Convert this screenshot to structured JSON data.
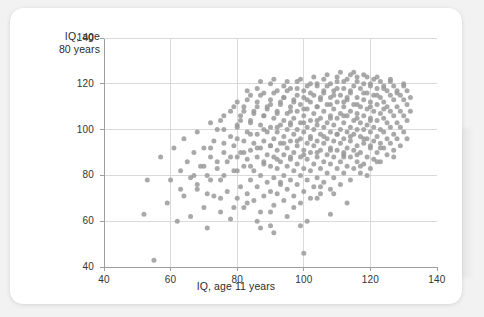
{
  "chart_data": {
    "type": "scatter",
    "title": "",
    "xlabel": "IQ, age 11 years",
    "ylabel": "IQ, age\n80 years",
    "xlim": [
      40,
      140
    ],
    "ylim": [
      40,
      140
    ],
    "xticks": [
      40,
      60,
      80,
      100,
      120,
      140
    ],
    "yticks": [
      40,
      60,
      80,
      100,
      120,
      140
    ],
    "grid": true,
    "legend": null,
    "marker": {
      "shape": "circle",
      "color": "#9a9a9a",
      "size_px": 5,
      "opacity": 0.85
    },
    "n_points": 420,
    "points": [
      [
        53,
        78
      ],
      [
        52,
        63
      ],
      [
        55,
        43
      ],
      [
        57,
        88
      ],
      [
        59,
        68
      ],
      [
        60,
        78
      ],
      [
        61,
        92
      ],
      [
        62,
        60
      ],
      [
        63,
        82
      ],
      [
        64,
        71
      ],
      [
        64,
        96
      ],
      [
        65,
        86
      ],
      [
        66,
        62
      ],
      [
        66,
        79
      ],
      [
        67,
        90
      ],
      [
        68,
        74
      ],
      [
        68,
        99
      ],
      [
        69,
        84
      ],
      [
        70,
        66
      ],
      [
        70,
        92
      ],
      [
        71,
        57
      ],
      [
        71,
        80
      ],
      [
        72,
        88
      ],
      [
        72,
        103
      ],
      [
        73,
        71
      ],
      [
        73,
        95
      ],
      [
        74,
        83
      ],
      [
        74,
        100
      ],
      [
        75,
        64
      ],
      [
        75,
        78
      ],
      [
        76,
        90
      ],
      [
        76,
        106
      ],
      [
        77,
        73
      ],
      [
        77,
        86
      ],
      [
        78,
        97
      ],
      [
        78,
        61
      ],
      [
        79,
        82
      ],
      [
        79,
        93
      ],
      [
        80,
        70
      ],
      [
        80,
        88
      ],
      [
        80,
        101
      ],
      [
        80,
        112
      ],
      [
        81,
        75
      ],
      [
        81,
        90
      ],
      [
        81,
        104
      ],
      [
        82,
        66
      ],
      [
        82,
        84
      ],
      [
        82,
        95
      ],
      [
        82,
        108
      ],
      [
        83,
        72
      ],
      [
        83,
        87
      ],
      [
        83,
        99
      ],
      [
        83,
        113
      ],
      [
        84,
        78
      ],
      [
        84,
        91
      ],
      [
        84,
        103
      ],
      [
        85,
        69
      ],
      [
        85,
        82
      ],
      [
        85,
        94
      ],
      [
        85,
        107
      ],
      [
        86,
        75
      ],
      [
        86,
        88
      ],
      [
        86,
        98
      ],
      [
        86,
        110
      ],
      [
        87,
        64
      ],
      [
        87,
        80
      ],
      [
        87,
        92
      ],
      [
        87,
        102
      ],
      [
        87,
        115
      ],
      [
        88,
        71
      ],
      [
        88,
        85
      ],
      [
        88,
        95
      ],
      [
        88,
        106
      ],
      [
        89,
        77
      ],
      [
        89,
        89
      ],
      [
        89,
        99
      ],
      [
        89,
        109
      ],
      [
        90,
        58
      ],
      [
        90,
        73
      ],
      [
        90,
        84
      ],
      [
        90,
        93
      ],
      [
        90,
        101
      ],
      [
        90,
        111
      ],
      [
        91,
        67
      ],
      [
        91,
        79
      ],
      [
        91,
        88
      ],
      [
        91,
        96
      ],
      [
        91,
        105
      ],
      [
        91,
        116
      ],
      [
        92,
        72
      ],
      [
        92,
        83
      ],
      [
        92,
        91
      ],
      [
        92,
        99
      ],
      [
        92,
        108
      ],
      [
        93,
        76
      ],
      [
        93,
        86
      ],
      [
        93,
        94
      ],
      [
        93,
        102
      ],
      [
        93,
        112
      ],
      [
        94,
        69
      ],
      [
        94,
        80
      ],
      [
        94,
        89
      ],
      [
        94,
        97
      ],
      [
        94,
        104
      ],
      [
        94,
        114
      ],
      [
        95,
        74
      ],
      [
        95,
        84
      ],
      [
        95,
        92
      ],
      [
        95,
        100
      ],
      [
        95,
        107
      ],
      [
        95,
        117
      ],
      [
        96,
        78
      ],
      [
        96,
        87
      ],
      [
        96,
        95
      ],
      [
        96,
        103
      ],
      [
        96,
        110
      ],
      [
        97,
        71
      ],
      [
        97,
        82
      ],
      [
        97,
        90
      ],
      [
        97,
        98
      ],
      [
        97,
        105
      ],
      [
        97,
        113
      ],
      [
        98,
        76
      ],
      [
        98,
        85
      ],
      [
        98,
        93
      ],
      [
        98,
        100
      ],
      [
        98,
        108
      ],
      [
        98,
        118
      ],
      [
        99,
        68
      ],
      [
        99,
        80
      ],
      [
        99,
        88
      ],
      [
        99,
        96
      ],
      [
        99,
        103
      ],
      [
        99,
        111
      ],
      [
        100,
        46
      ],
      [
        100,
        73
      ],
      [
        100,
        83
      ],
      [
        100,
        91
      ],
      [
        100,
        99
      ],
      [
        100,
        106
      ],
      [
        100,
        114
      ],
      [
        101,
        78
      ],
      [
        101,
        87
      ],
      [
        101,
        94
      ],
      [
        101,
        101
      ],
      [
        101,
        109
      ],
      [
        101,
        119
      ],
      [
        102,
        70
      ],
      [
        102,
        82
      ],
      [
        102,
        90
      ],
      [
        102,
        97
      ],
      [
        102,
        104
      ],
      [
        102,
        112
      ],
      [
        103,
        75
      ],
      [
        103,
        85
      ],
      [
        103,
        93
      ],
      [
        103,
        100
      ],
      [
        103,
        107
      ],
      [
        103,
        115
      ],
      [
        104,
        79
      ],
      [
        104,
        88
      ],
      [
        104,
        95
      ],
      [
        104,
        102
      ],
      [
        104,
        110
      ],
      [
        104,
        120
      ],
      [
        105,
        72
      ],
      [
        105,
        83
      ],
      [
        105,
        91
      ],
      [
        105,
        98
      ],
      [
        105,
        105
      ],
      [
        105,
        113
      ],
      [
        106,
        77
      ],
      [
        106,
        86
      ],
      [
        106,
        94
      ],
      [
        106,
        101
      ],
      [
        106,
        108
      ],
      [
        106,
        116
      ],
      [
        107,
        81
      ],
      [
        107,
        89
      ],
      [
        107,
        96
      ],
      [
        107,
        103
      ],
      [
        107,
        111
      ],
      [
        107,
        119
      ],
      [
        108,
        74
      ],
      [
        108,
        85
      ],
      [
        108,
        92
      ],
      [
        108,
        99
      ],
      [
        108,
        106
      ],
      [
        108,
        114
      ],
      [
        109,
        79
      ],
      [
        109,
        88
      ],
      [
        109,
        95
      ],
      [
        109,
        102
      ],
      [
        109,
        109
      ],
      [
        109,
        117
      ],
      [
        110,
        83
      ],
      [
        110,
        91
      ],
      [
        110,
        98
      ],
      [
        110,
        105
      ],
      [
        110,
        112
      ],
      [
        110,
        121
      ],
      [
        111,
        76
      ],
      [
        111,
        86
      ],
      [
        111,
        94
      ],
      [
        111,
        100
      ],
      [
        111,
        107
      ],
      [
        111,
        115
      ],
      [
        112,
        81
      ],
      [
        112,
        89
      ],
      [
        112,
        96
      ],
      [
        112,
        103
      ],
      [
        112,
        110
      ],
      [
        112,
        118
      ],
      [
        113,
        84
      ],
      [
        113,
        92
      ],
      [
        113,
        99
      ],
      [
        113,
        106
      ],
      [
        113,
        113
      ],
      [
        113,
        122
      ],
      [
        114,
        78
      ],
      [
        114,
        88
      ],
      [
        114,
        95
      ],
      [
        114,
        101
      ],
      [
        114,
        108
      ],
      [
        114,
        116
      ],
      [
        115,
        83
      ],
      [
        115,
        91
      ],
      [
        115,
        98
      ],
      [
        115,
        104
      ],
      [
        115,
        111
      ],
      [
        115,
        119
      ],
      [
        116,
        86
      ],
      [
        116,
        93
      ],
      [
        116,
        100
      ],
      [
        116,
        107
      ],
      [
        116,
        114
      ],
      [
        116,
        123
      ],
      [
        117,
        81
      ],
      [
        117,
        90
      ],
      [
        117,
        97
      ],
      [
        117,
        103
      ],
      [
        117,
        110
      ],
      [
        117,
        118
      ],
      [
        118,
        85
      ],
      [
        118,
        94
      ],
      [
        118,
        100
      ],
      [
        118,
        106
      ],
      [
        118,
        113
      ],
      [
        118,
        120
      ],
      [
        119,
        88
      ],
      [
        119,
        96
      ],
      [
        119,
        102
      ],
      [
        119,
        109
      ],
      [
        119,
        116
      ],
      [
        120,
        83
      ],
      [
        120,
        92
      ],
      [
        120,
        99
      ],
      [
        120,
        105
      ],
      [
        120,
        112
      ],
      [
        120,
        119
      ],
      [
        121,
        87
      ],
      [
        121,
        95
      ],
      [
        121,
        101
      ],
      [
        121,
        108
      ],
      [
        121,
        115
      ],
      [
        121,
        122
      ],
      [
        122,
        90
      ],
      [
        122,
        97
      ],
      [
        122,
        104
      ],
      [
        122,
        111
      ],
      [
        122,
        118
      ],
      [
        123,
        86
      ],
      [
        123,
        94
      ],
      [
        123,
        100
      ],
      [
        123,
        107
      ],
      [
        123,
        114
      ],
      [
        123,
        121
      ],
      [
        124,
        92
      ],
      [
        124,
        99
      ],
      [
        124,
        105
      ],
      [
        124,
        112
      ],
      [
        124,
        119
      ],
      [
        125,
        89
      ],
      [
        125,
        96
      ],
      [
        125,
        103
      ],
      [
        125,
        110
      ],
      [
        125,
        117
      ],
      [
        126,
        94
      ],
      [
        126,
        101
      ],
      [
        126,
        108
      ],
      [
        126,
        115
      ],
      [
        126,
        121
      ],
      [
        127,
        91
      ],
      [
        127,
        98
      ],
      [
        127,
        106
      ],
      [
        127,
        113
      ],
      [
        127,
        119
      ],
      [
        128,
        96
      ],
      [
        128,
        103
      ],
      [
        128,
        110
      ],
      [
        128,
        117
      ],
      [
        129,
        93
      ],
      [
        129,
        101
      ],
      [
        129,
        108
      ],
      [
        129,
        115
      ],
      [
        130,
        99
      ],
      [
        130,
        106
      ],
      [
        130,
        113
      ],
      [
        130,
        119
      ],
      [
        131,
        104
      ],
      [
        131,
        111
      ],
      [
        131,
        117
      ],
      [
        132,
        108
      ],
      [
        132,
        114
      ],
      [
        86,
        118
      ],
      [
        90,
        120
      ],
      [
        94,
        119
      ],
      [
        98,
        121
      ],
      [
        102,
        120
      ],
      [
        106,
        122
      ],
      [
        110,
        123
      ],
      [
        114,
        124
      ],
      [
        118,
        124
      ],
      [
        122,
        123
      ],
      [
        126,
        122
      ],
      [
        130,
        120
      ],
      [
        84,
        115
      ],
      [
        88,
        116
      ],
      [
        92,
        117
      ],
      [
        96,
        118
      ],
      [
        100,
        117
      ],
      [
        104,
        119
      ],
      [
        108,
        120
      ],
      [
        112,
        121
      ],
      [
        116,
        121
      ],
      [
        120,
        120
      ],
      [
        124,
        118
      ],
      [
        128,
        116
      ],
      [
        78,
        108
      ],
      [
        82,
        110
      ],
      [
        86,
        112
      ],
      [
        90,
        113
      ],
      [
        94,
        114
      ],
      [
        98,
        115
      ],
      [
        102,
        116
      ],
      [
        106,
        117
      ],
      [
        110,
        118
      ],
      [
        114,
        117
      ],
      [
        118,
        116
      ],
      [
        122,
        115
      ],
      [
        76,
        100
      ],
      [
        80,
        102
      ],
      [
        84,
        104
      ],
      [
        88,
        106
      ],
      [
        92,
        107
      ],
      [
        96,
        108
      ],
      [
        100,
        109
      ],
      [
        104,
        110
      ],
      [
        108,
        111
      ],
      [
        112,
        112
      ],
      [
        116,
        111
      ],
      [
        120,
        110
      ],
      [
        124,
        109
      ],
      [
        72,
        92
      ],
      [
        76,
        94
      ],
      [
        80,
        96
      ],
      [
        84,
        98
      ],
      [
        88,
        100
      ],
      [
        92,
        101
      ],
      [
        96,
        102
      ],
      [
        100,
        103
      ],
      [
        104,
        104
      ],
      [
        108,
        105
      ],
      [
        112,
        106
      ],
      [
        116,
        105
      ],
      [
        120,
        104
      ],
      [
        70,
        84
      ],
      [
        74,
        86
      ],
      [
        78,
        88
      ],
      [
        82,
        90
      ],
      [
        86,
        92
      ],
      [
        90,
        93
      ],
      [
        94,
        94
      ],
      [
        98,
        95
      ],
      [
        102,
        96
      ],
      [
        106,
        97
      ],
      [
        110,
        98
      ],
      [
        114,
        97
      ],
      [
        118,
        96
      ],
      [
        68,
        76
      ],
      [
        72,
        78
      ],
      [
        76,
        80
      ],
      [
        80,
        82
      ],
      [
        84,
        84
      ],
      [
        88,
        86
      ],
      [
        92,
        87
      ],
      [
        96,
        88
      ],
      [
        100,
        89
      ],
      [
        104,
        90
      ],
      [
        108,
        91
      ],
      [
        112,
        90
      ],
      [
        116,
        89
      ],
      [
        95,
        62
      ],
      [
        99,
        58
      ],
      [
        104,
        70
      ],
      [
        108,
        63
      ],
      [
        112,
        88
      ],
      [
        117,
        84
      ],
      [
        120,
        93
      ],
      [
        122,
        86
      ],
      [
        86,
        60
      ],
      [
        90,
        64
      ],
      [
        79,
        66
      ],
      [
        83,
        68
      ],
      [
        75,
        70
      ],
      [
        71,
        72
      ],
      [
        67,
        80
      ],
      [
        63,
        74
      ],
      [
        91,
        55
      ],
      [
        87,
        57
      ],
      [
        93,
        77
      ],
      [
        97,
        66
      ],
      [
        101,
        60
      ],
      [
        105,
        75
      ],
      [
        109,
        72
      ],
      [
        113,
        68
      ],
      [
        119,
        80
      ],
      [
        123,
        92
      ],
      [
        127,
        88
      ],
      [
        131,
        96
      ],
      [
        107,
        124
      ],
      [
        111,
        125
      ],
      [
        115,
        125
      ],
      [
        119,
        123
      ],
      [
        103,
        123
      ],
      [
        99,
        122
      ],
      [
        95,
        121
      ],
      [
        91,
        122
      ],
      [
        87,
        121
      ],
      [
        83,
        117
      ],
      [
        79,
        110
      ],
      [
        75,
        104
      ],
      [
        81,
        106
      ],
      [
        85,
        108
      ],
      [
        89,
        110
      ],
      [
        93,
        111
      ],
      [
        97,
        112
      ],
      [
        101,
        113
      ],
      [
        105,
        114
      ],
      [
        109,
        115
      ],
      [
        113,
        114
      ]
    ]
  }
}
